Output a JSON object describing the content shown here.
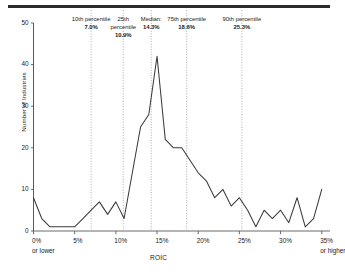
{
  "figure": {
    "top_rule": "horizontal-rule"
  },
  "chart_data": {
    "type": "line",
    "title": "",
    "xlabel": "ROIC",
    "ylabel": "Number of Industries",
    "xlim": [
      0,
      36
    ],
    "ylim": [
      0,
      50
    ],
    "grid": false,
    "legend": null,
    "x_ticks": [
      {
        "value": 0,
        "label": "0%",
        "sublabel": "or lower"
      },
      {
        "value": 5,
        "label": "5%",
        "sublabel": ""
      },
      {
        "value": 10,
        "label": "10%",
        "sublabel": ""
      },
      {
        "value": 15,
        "label": "15%",
        "sublabel": ""
      },
      {
        "value": 20,
        "label": "20%",
        "sublabel": ""
      },
      {
        "value": 25,
        "label": "25%",
        "sublabel": ""
      },
      {
        "value": 30,
        "label": "30%",
        "sublabel": ""
      },
      {
        "value": 35,
        "label": "35%",
        "sublabel": "or higher"
      }
    ],
    "y_ticks": [
      {
        "value": 0,
        "label": "0"
      },
      {
        "value": 10,
        "label": "10"
      },
      {
        "value": 20,
        "label": "20"
      },
      {
        "value": 30,
        "label": "30"
      },
      {
        "value": 40,
        "label": "40"
      },
      {
        "value": 50,
        "label": "50"
      }
    ],
    "x": [
      0,
      1,
      2,
      3,
      4,
      5,
      6,
      7,
      8,
      9,
      10,
      11,
      12,
      13,
      14,
      15,
      16,
      17,
      18,
      19,
      20,
      21,
      22,
      23,
      24,
      25,
      26,
      27,
      28,
      29,
      30,
      31,
      32,
      33,
      34,
      35
    ],
    "values": [
      8,
      3,
      1,
      1,
      1,
      1,
      3,
      5,
      7,
      4,
      7,
      3,
      14,
      25,
      28,
      42,
      22,
      20,
      20,
      17,
      14,
      12,
      8,
      10,
      6,
      8,
      5,
      1,
      5,
      3,
      5,
      2,
      8,
      1,
      3,
      10
    ],
    "series": [
      {
        "name": "Number of Industries",
        "values": [
          8,
          3,
          1,
          1,
          1,
          1,
          3,
          5,
          7,
          4,
          7,
          3,
          14,
          25,
          28,
          42,
          22,
          20,
          20,
          17,
          14,
          12,
          8,
          10,
          6,
          8,
          5,
          1,
          5,
          3,
          5,
          2,
          8,
          1,
          3,
          10
        ],
        "color": "#3a3a3a"
      }
    ],
    "annotations": [
      {
        "name": "10th percentile",
        "value": "7.0%",
        "x": 7.0,
        "label_x": 7.0,
        "multiline_name": [
          "10th percentile"
        ]
      },
      {
        "name": "25th percentile",
        "value": "10.9%",
        "x": 10.9,
        "label_x": 10.9,
        "multiline_name": [
          "25th",
          "percentile"
        ]
      },
      {
        "name": "Median:",
        "value": "14.3%",
        "x": 14.3,
        "label_x": 14.3,
        "multiline_name": [
          "Median:"
        ]
      },
      {
        "name": "75th percentile",
        "value": "18.6%",
        "x": 18.6,
        "label_x": 18.6,
        "multiline_name": [
          "75th percentile"
        ]
      },
      {
        "name": "90th percentile",
        "value": "25.3%",
        "x": 25.3,
        "label_x": 25.3,
        "multiline_name": [
          "90th percentile"
        ]
      }
    ],
    "marker_line_style": "dotted",
    "marker_line_color": "#9a9a9a",
    "axis_color": "#5a5a5a"
  }
}
